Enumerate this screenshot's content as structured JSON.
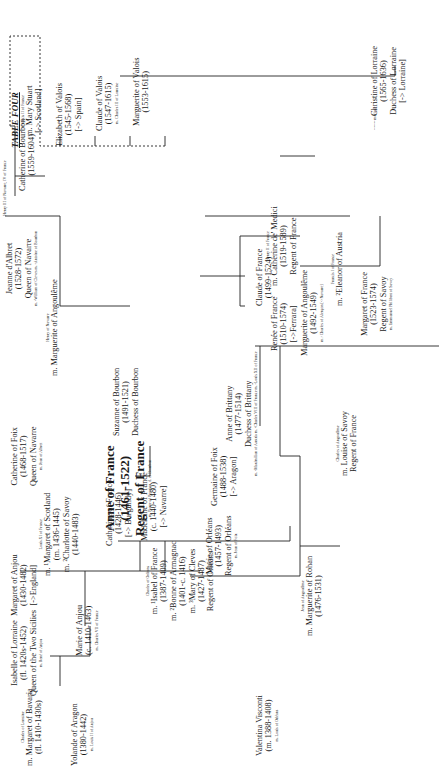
{
  "title": "TABLE FOUR",
  "legend": {
    "line": "-------",
    "label": "mariage"
  },
  "people": [
    {
      "id": "margaret-bavaria",
      "pre": "Charles of Lorraine",
      "lines": [
        "m. Margaret of Bavaria",
        "(fl. 1410-1430s)"
      ],
      "post": ""
    },
    {
      "id": "isabelle-lorraine",
      "pre": "",
      "lines": [
        "Isabelle of Lorraine",
        "(fl. 1420s-1452)",
        "Queen of the Two Sicilies"
      ],
      "post": "m. René of Anjou"
    },
    {
      "id": "yolande-aragon",
      "pre": "",
      "lines": [
        "Yolande of Aragon",
        "(1380-1442)"
      ],
      "post": "m. Louis II of Anjou"
    },
    {
      "id": "marie-anjou",
      "pre": "",
      "lines": [
        "Marie of Anjou",
        "(c. 1410-1463)"
      ],
      "post": "m. Charles VII of France"
    },
    {
      "id": "margaret-anjou",
      "pre": "",
      "lines": [
        "Margaret of Anjou",
        "(1430-1482)",
        "[->England]"
      ],
      "post": ""
    },
    {
      "id": "margaret-scotland",
      "pre": "Louis XI of France",
      "lines": [
        "m. ¹Margaret of Scotland",
        "(m. 1436-1445)",
        "m. ²Charlotte of Savoy",
        "(1440-1483)"
      ],
      "post": ""
    },
    {
      "id": "catherine-france-1428",
      "pre": "",
      "lines": [
        "Catherine of France",
        "(1428-1446)",
        "[-> Burgundy]"
      ],
      "post": ""
    },
    {
      "id": "madeleine-france",
      "pre": "",
      "lines": [
        "Madeleine of France",
        "(c. 1440-1480)",
        "[-> Navarre]"
      ],
      "post": ""
    },
    {
      "id": "catherine-foix",
      "pre": "",
      "lines": [
        "Catherine of Foix",
        "(1468-1517)",
        "Queen of Navarre"
      ],
      "post": "m. Jean of Albret"
    },
    {
      "id": "anne-france",
      "pre": "",
      "big": [
        "Anne of France",
        "(1461-1522)",
        "Regent of France"
      ],
      "post": "m. Pierre of Beaujeu, d. of Bourbon"
    },
    {
      "id": "suzanne-bourbon",
      "pre": "",
      "lines": [
        "Suzanne of Bourbon",
        "(1491-1521)",
        "Duchess of Bourbon"
      ],
      "post": ""
    },
    {
      "id": "marguerite-angouleme-1",
      "pre": "Henry of Navarre",
      "lines": [
        "m. Marguerite of Angoulême"
      ],
      "post": ""
    },
    {
      "id": "jeanne-albret",
      "pre": "",
      "lines": [
        "Jeanne d'Albret",
        "(1528-1572)",
        "Queen of Navarre"
      ],
      "post": "m. ¹William of Cleves  m. ²Antoine of Bourbon"
    },
    {
      "id": "catherine-bourbon",
      "pre": "",
      "lines": [
        "Catherine of Bourbon",
        "(1559-1604)"
      ],
      "post": ""
    },
    {
      "id": "henry-navarre",
      "pre": "",
      "lines": [
        "Henry III of Navarre, IV of France"
      ],
      "post": "",
      "small": true
    },
    {
      "id": "isabel-france",
      "pre": "Charles of Orléans",
      "lines": [
        "m. ¹Isabel of France",
        "(1387-1409)",
        "m. ²Bonne of Armagnac",
        "(1401-c. 1416)",
        "m. ³Mary of Cleves",
        "(1427-1487)",
        "Regent of Orléans"
      ],
      "post": ""
    },
    {
      "id": "marie-orleans",
      "pre": "",
      "lines": [
        "Marie of Orléans",
        "(1457-1493)",
        "Regent of Orléans"
      ],
      "post": "m. Jean of Foix"
    },
    {
      "id": "germaine-foix",
      "pre": "",
      "lines": [
        "Germaine of Foix",
        "(1488-1538)",
        "[-> Aragon]"
      ],
      "post": ""
    },
    {
      "id": "anne-brittany",
      "pre": "",
      "lines": [
        "Anne of Brittany",
        "(1477-1514)",
        "Duchess of Brittany"
      ],
      "post": "m. ¹Maximilian of Austria  m. ²Charles VIII of France  m. ³Louis XII of France"
    },
    {
      "id": "claude-france",
      "pre": "",
      "lines": [
        "Claude of France",
        "(1499-1524)"
      ],
      "post": ""
    },
    {
      "id": "catherine-medici",
      "pre": "Henry II of France",
      "lines": [
        "m. Catherine de' Medici",
        "(1519-1589)",
        "Regent of France"
      ],
      "post": ""
    },
    {
      "id": "mary-stuart",
      "pre": "Francis II of France",
      "lines": [
        "m. Mary Stuart",
        "[-> Scotland]"
      ],
      "post": ""
    },
    {
      "id": "elizabeth-valois",
      "pre": "",
      "lines": [
        "Elizabeth of Valois",
        "(1545-1568)",
        "[-> Spain]"
      ],
      "post": ""
    },
    {
      "id": "claude-valois",
      "pre": "",
      "lines": [
        "Claude of Valois",
        "(1547-1615)"
      ],
      "post": "m. Charles III of Lorraine"
    },
    {
      "id": "marguerite-valois",
      "pre": "",
      "lines": [
        "Marguerite of Valois",
        "(1553-1615)"
      ],
      "post": ""
    },
    {
      "id": "renee-france",
      "pre": "",
      "lines": [
        "Renée of France",
        "(1510-1574)",
        "[->Ferrara]"
      ],
      "post": ""
    },
    {
      "id": "marguerite-angouleme-2",
      "pre": "",
      "lines": [
        "Marguerite of Angoulême",
        "(1492-1549)"
      ],
      "post": "m.¹ Charles of Alençon  [->Navarre]"
    },
    {
      "id": "eleanor-austria",
      "pre": "Francis I of France",
      "lines": [
        "m. ²Eleanor of Austria"
      ],
      "post": ""
    },
    {
      "id": "margaret-france",
      "pre": "",
      "lines": [
        "Margaret of France",
        "(1523-1574)",
        "Regent of Savoy"
      ],
      "post": "m. Emmanuel Philibert of Savoy"
    },
    {
      "id": "christine-lorraine",
      "pre": "",
      "lines": [
        "Christine of Lorraine",
        "(1565-1636)",
        "Duchess of Lorraine",
        "[-> Lorraine]"
      ],
      "post": ""
    },
    {
      "id": "valentina-visconti",
      "pre": "",
      "lines": [
        "Valentina Visconti",
        "(m. 1388-1408)"
      ],
      "post": "m. Louis of Orléans"
    },
    {
      "id": "marguerite-rohan",
      "pre": "Jean of Angoulême",
      "lines": [
        "m. Marguerite of Rohan",
        "(1476-1531)"
      ],
      "post": ""
    },
    {
      "id": "louise-savoy",
      "pre": "Charles of Angoulême",
      "lines": [
        "m. Louise of Savoy",
        "Regent of France"
      ],
      "post": ""
    }
  ]
}
